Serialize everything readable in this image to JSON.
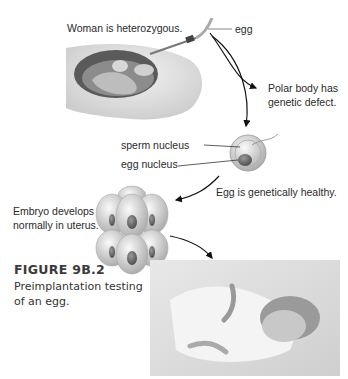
{
  "diagram": {
    "labels": {
      "woman": "Woman is heterozygous.",
      "egg": "egg",
      "polar_body_1": "Polar body has",
      "polar_body_2": "genetic defect.",
      "sperm_nucleus": "sperm nucleus",
      "egg_nucleus": "egg nucleus",
      "egg_healthy": "Egg is genetically healthy.",
      "embryo_1": "Embryo develops",
      "embryo_2": "normally in uterus."
    },
    "illustrations": [
      "needle-egg-retrieval",
      "fertilized-egg",
      "eight-cell-embryo",
      "sleeping-newborn-photo"
    ]
  },
  "caption": {
    "title": "FIGURE 9B.2",
    "line1": "Preimplantation testing",
    "line2": "of an egg."
  }
}
